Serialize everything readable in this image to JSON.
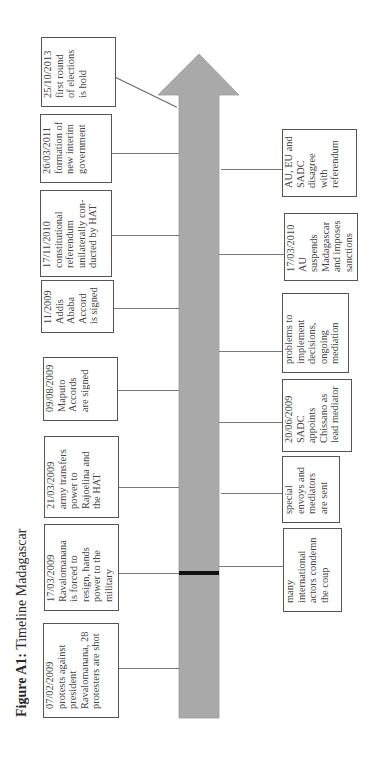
{
  "figure": {
    "title_bold": "Figure A1:",
    "title_rest": " Timeline Madagascar",
    "arrow_color": "#a9a9a9",
    "marker_color": "#111111"
  },
  "timeline_left": [
    {
      "date": "07/02/2009",
      "text": "protests against president Ravalomanana, 28 protesters are shot"
    },
    {
      "date": "17/03/2009",
      "text": "Ravalomanana is forced to resign, hands power to the military"
    },
    {
      "date": "21/03/2009",
      "text": "army transfers power to Rajoelina and the HAT"
    },
    {
      "date": "09/08/2009",
      "text": "Maputo Accords are signed"
    },
    {
      "date": "11/2009",
      "text": "Addis Ababa Accord is signed"
    },
    {
      "date": "17/11/2010",
      "text": "constitutional referendum unilaterally con-ducted by HAT"
    },
    {
      "date": "26/03/2011",
      "text": "formation of new interim government"
    },
    {
      "date": "25/10/2013",
      "text": "first round of elections is hold"
    }
  ],
  "timeline_right": [
    {
      "date": "",
      "text": "many international actors condemn the coup"
    },
    {
      "date": "",
      "text": "special envoys and mediators are sent"
    },
    {
      "date": "20/06/2009",
      "text": "SADC appoints Chissano as lead mediator"
    },
    {
      "date": "",
      "text": "problems to implement decisions, ongoing mediation"
    },
    {
      "date": "17/03/2010",
      "text": "AU suspends Madagascar and imposes sanctions"
    },
    {
      "date": "",
      "text": "AU, EU and SADC disagree with referendum"
    }
  ]
}
